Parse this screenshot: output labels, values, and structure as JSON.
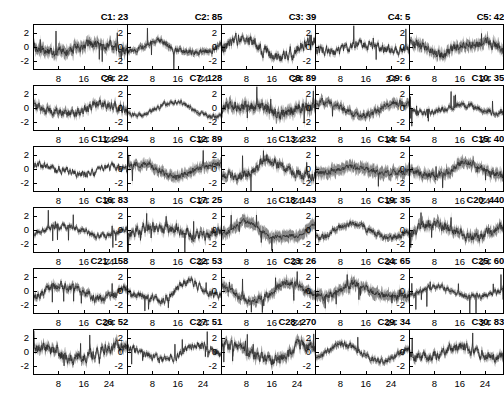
{
  "figure": {
    "type": "small-multiples-timeseries-grid",
    "rows": 6,
    "cols": 5,
    "panel_count": 30,
    "title_format": "C{n}: {count}",
    "y_ticklabels": [
      "2",
      "0",
      "-2"
    ],
    "x_ticklabels": [
      "8",
      "16",
      "24"
    ],
    "ylim": [
      -3.2,
      3.2
    ],
    "xlim": [
      0,
      30
    ],
    "band_color": "#8a8a8a",
    "mean_color": "#2b2b2b",
    "axis_color": "#000000",
    "background": "#ffffff"
  },
  "chart_data": {
    "type": "line",
    "title": "",
    "xlabel": "",
    "ylabel": "",
    "xlim": [
      0,
      30
    ],
    "ylim": [
      -3.2,
      3.2
    ],
    "grid": false,
    "legend": "none",
    "xticks": [
      8,
      16,
      24
    ],
    "yticks": [
      2,
      0,
      -2
    ],
    "panels": [
      {
        "id": "C1",
        "label": "C1: 23",
        "count": 23,
        "row": 1,
        "col": 1
      },
      {
        "id": "C2",
        "label": "C2: 85",
        "count": 85,
        "row": 1,
        "col": 2
      },
      {
        "id": "C3",
        "label": "C3: 39",
        "count": 39,
        "row": 1,
        "col": 3
      },
      {
        "id": "C4",
        "label": "C4: 5",
        "count": 5,
        "row": 1,
        "col": 4
      },
      {
        "id": "C5",
        "label": "C5: 42",
        "count": 42,
        "row": 1,
        "col": 5
      },
      {
        "id": "C6",
        "label": "C6: 22",
        "count": 22,
        "row": 2,
        "col": 1
      },
      {
        "id": "C7",
        "label": "C7: 128",
        "count": 128,
        "row": 2,
        "col": 2
      },
      {
        "id": "C8",
        "label": "C8: 89",
        "count": 89,
        "row": 2,
        "col": 3
      },
      {
        "id": "C9",
        "label": "C9: 6",
        "count": 6,
        "row": 2,
        "col": 4
      },
      {
        "id": "C10",
        "label": "C10: 35",
        "count": 35,
        "row": 2,
        "col": 5
      },
      {
        "id": "C11",
        "label": "C11: 294",
        "count": 294,
        "row": 3,
        "col": 1
      },
      {
        "id": "C12",
        "label": "C12: 89",
        "count": 89,
        "row": 3,
        "col": 2
      },
      {
        "id": "C13",
        "label": "C13: 232",
        "count": 232,
        "row": 3,
        "col": 3
      },
      {
        "id": "C14",
        "label": "C14: 54",
        "count": 54,
        "row": 3,
        "col": 4
      },
      {
        "id": "C15",
        "label": "C15: 40",
        "count": 40,
        "row": 3,
        "col": 5
      },
      {
        "id": "C16",
        "label": "C16: 83",
        "count": 83,
        "row": 4,
        "col": 1
      },
      {
        "id": "C17",
        "label": "C17: 25",
        "count": 25,
        "row": 4,
        "col": 2
      },
      {
        "id": "C18",
        "label": "C18: 143",
        "count": 143,
        "row": 4,
        "col": 3
      },
      {
        "id": "C19",
        "label": "C19: 35",
        "count": 35,
        "row": 4,
        "col": 4
      },
      {
        "id": "C20",
        "label": "C20: 440",
        "count": 440,
        "row": 4,
        "col": 5
      },
      {
        "id": "C21",
        "label": "C21: 158",
        "count": 158,
        "row": 5,
        "col": 1
      },
      {
        "id": "C22",
        "label": "C22: 53",
        "count": 53,
        "row": 5,
        "col": 2
      },
      {
        "id": "C23",
        "label": "C23: 26",
        "count": 26,
        "row": 5,
        "col": 3
      },
      {
        "id": "C24",
        "label": "C24: 65",
        "count": 65,
        "row": 5,
        "col": 4
      },
      {
        "id": "C25",
        "label": "C25: 60",
        "count": 60,
        "row": 5,
        "col": 5
      },
      {
        "id": "C26",
        "label": "C26: 52",
        "count": 52,
        "row": 6,
        "col": 1
      },
      {
        "id": "C27",
        "label": "C27: 51",
        "count": 51,
        "row": 6,
        "col": 2
      },
      {
        "id": "C28",
        "label": "C28: 270",
        "count": 270,
        "row": 6,
        "col": 3
      },
      {
        "id": "C29",
        "label": "C29: 34",
        "count": 34,
        "row": 6,
        "col": 4
      },
      {
        "id": "C30",
        "label": "C30: 83",
        "count": 83,
        "row": 6,
        "col": 5
      }
    ]
  }
}
